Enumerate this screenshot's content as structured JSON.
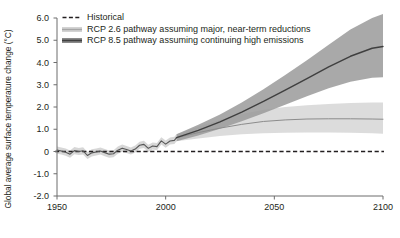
{
  "chart_data": {
    "type": "line",
    "title": "",
    "xlabel": "",
    "ylabel": "Global average surface temperature change (°C)",
    "xlim": [
      1950,
      2100
    ],
    "ylim": [
      -2.0,
      6.0
    ],
    "grid": false,
    "legend_position": "top-left",
    "x_ticks": [
      "1950",
      "2000",
      "2050",
      "2100"
    ],
    "x_tick_values": [
      1950,
      2000,
      2050,
      2100
    ],
    "y_ticks": [
      "6.0",
      "5.0",
      "4.0",
      "3.0",
      "2.0",
      "1.0",
      "0",
      "-1.0",
      "-2.0"
    ],
    "y_tick_values": [
      6.0,
      5.0,
      4.0,
      3.0,
      2.0,
      1.0,
      0,
      -1.0,
      -2.0
    ],
    "reference_line": {
      "label": "zero-reference",
      "y": 0,
      "style": "dashed",
      "color": "#231f20"
    },
    "colors": {
      "historical_line": "#555555",
      "historical_band": "#d5d5d5",
      "rcp26_line": "#8c8c8c",
      "rcp26_band": "#d9d9d9",
      "rcp85_line": "#3f3f3f",
      "rcp85_band": "#9a9a9a",
      "axis": "#6d6d6d",
      "text": "#231f20"
    },
    "series": [
      {
        "name": "Historical",
        "key": "historical",
        "style": "line-with-band",
        "x": [
          1950,
          1952,
          1954,
          1956,
          1958,
          1960,
          1962,
          1964,
          1966,
          1968,
          1970,
          1972,
          1974,
          1976,
          1978,
          1980,
          1982,
          1984,
          1986,
          1988,
          1990,
          1992,
          1994,
          1996,
          1998,
          2000,
          2002,
          2004,
          2005
        ],
        "values": [
          0.06,
          0.02,
          -0.03,
          -0.12,
          0.04,
          0.0,
          0.03,
          -0.18,
          -0.06,
          -0.02,
          0.02,
          -0.05,
          -0.12,
          -0.1,
          0.06,
          0.15,
          0.09,
          0.02,
          0.11,
          0.28,
          0.32,
          0.14,
          0.25,
          0.22,
          0.48,
          0.33,
          0.47,
          0.5,
          0.62
        ],
        "band_lower": [
          -0.1,
          -0.14,
          -0.19,
          -0.28,
          -0.12,
          -0.16,
          -0.13,
          -0.34,
          -0.22,
          -0.18,
          -0.14,
          -0.21,
          -0.28,
          -0.26,
          -0.1,
          -0.01,
          -0.07,
          -0.14,
          -0.05,
          0.12,
          0.16,
          -0.02,
          0.09,
          0.06,
          0.32,
          0.17,
          0.31,
          0.34,
          0.46
        ],
        "band_upper": [
          0.22,
          0.18,
          0.13,
          0.04,
          0.2,
          0.16,
          0.19,
          -0.02,
          0.1,
          0.14,
          0.18,
          0.11,
          0.04,
          0.06,
          0.22,
          0.31,
          0.25,
          0.18,
          0.27,
          0.44,
          0.48,
          0.3,
          0.41,
          0.38,
          0.64,
          0.49,
          0.63,
          0.66,
          0.78
        ]
      },
      {
        "name": "RCP 2.6 pathway assuming major, near-term reductions",
        "key": "rcp26",
        "style": "line-with-band",
        "x": [
          2005,
          2015,
          2025,
          2035,
          2045,
          2055,
          2065,
          2075,
          2085,
          2095,
          2100
        ],
        "values": [
          0.62,
          0.85,
          1.05,
          1.22,
          1.35,
          1.42,
          1.46,
          1.47,
          1.47,
          1.46,
          1.45
        ],
        "band_lower": [
          0.46,
          0.58,
          0.7,
          0.78,
          0.82,
          0.84,
          0.85,
          0.85,
          0.84,
          0.82,
          0.8
        ],
        "band_upper": [
          0.78,
          1.12,
          1.42,
          1.68,
          1.88,
          2.0,
          2.08,
          2.14,
          2.18,
          2.2,
          2.2
        ]
      },
      {
        "name": "RCP 8.5 pathway assuming continuing high emissions",
        "key": "rcp85",
        "style": "line-with-band",
        "x": [
          2005,
          2015,
          2025,
          2035,
          2045,
          2055,
          2065,
          2075,
          2085,
          2095,
          2100
        ],
        "values": [
          0.62,
          0.95,
          1.33,
          1.77,
          2.25,
          2.76,
          3.28,
          3.8,
          4.28,
          4.64,
          4.72
        ],
        "band_lower": [
          0.46,
          0.72,
          1.02,
          1.36,
          1.72,
          2.1,
          2.48,
          2.84,
          3.14,
          3.32,
          3.34
        ],
        "band_upper": [
          0.78,
          1.2,
          1.66,
          2.2,
          2.8,
          3.44,
          4.1,
          4.8,
          5.48,
          6.0,
          6.18
        ]
      }
    ]
  },
  "axis": {
    "ylabel": "Global average surface temperature change (°C)"
  },
  "legend": {
    "items": [
      {
        "label": "Historical",
        "marker": "dashed-line-swatch"
      },
      {
        "label": "RCP 2.6 pathway assuming major, near-term reductions",
        "marker": "light-line-swatch"
      },
      {
        "label": "RCP 8.5 pathway assuming continuing high emissions",
        "marker": "dark-line-swatch"
      }
    ]
  }
}
